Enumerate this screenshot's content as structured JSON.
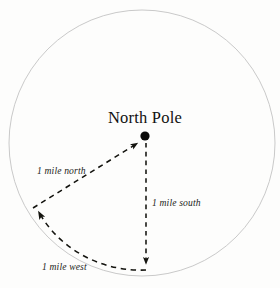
{
  "figure": {
    "background_color": "#fdfdfc",
    "title": "North Pole",
    "circle": {
      "center_x": 142,
      "center_y": 143,
      "radius": 133,
      "stroke_color": "#c3c3c3",
      "stroke_width": 0.9
    },
    "pole_marker": {
      "label": "north-pole-dot",
      "x": 145,
      "y": 136,
      "radius": 4.6,
      "color": "#0b0b0a"
    },
    "arrows": [
      {
        "id": "north-leg",
        "label": "1 mile north",
        "style": "dashed-straight",
        "from_x": 33,
        "from_y": 208,
        "to_x": 141,
        "to_y": 141,
        "color": "#14140f"
      },
      {
        "id": "south-leg",
        "label": "1 mile south",
        "style": "dashed-straight",
        "from_x": 146,
        "from_y": 143,
        "to_x": 146,
        "to_y": 270,
        "color": "#14140f"
      },
      {
        "id": "west-leg",
        "label": "1 mile west",
        "style": "dashed-arc",
        "from_x": 146,
        "from_y": 270,
        "to_x": 33,
        "to_y": 205,
        "color": "#14140f"
      }
    ],
    "labels": {
      "north": "1 mile north",
      "south": "1 mile south",
      "west": "1 mile west"
    }
  }
}
